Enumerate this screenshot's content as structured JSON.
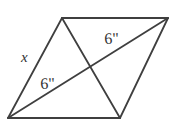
{
  "figure": {
    "type": "geometry-diagram",
    "shape_name": "parallelogram-with-diagonals",
    "background_color": "#ffffff",
    "stroke_color": "#3f3f3f",
    "stroke_width": 1.6,
    "canvas": {
      "width": 173,
      "height": 127
    },
    "vertices": {
      "top_left": {
        "x": 62,
        "y": 18
      },
      "top_right": {
        "x": 168,
        "y": 18
      },
      "bottom_right": {
        "x": 120,
        "y": 118
      },
      "bottom_left": {
        "x": 8,
        "y": 118
      }
    },
    "intersection_point": {
      "x": 88,
      "y": 68
    },
    "sides": [
      {
        "name": "top-side",
        "from": "top_left",
        "to": "top_right"
      },
      {
        "name": "right-side",
        "from": "top_right",
        "to": "bottom_right"
      },
      {
        "name": "bottom-side",
        "from": "bottom_right",
        "to": "bottom_left"
      },
      {
        "name": "left-side",
        "from": "bottom_left",
        "to": "top_left"
      }
    ],
    "diagonals": [
      {
        "name": "diagonal-bottomleft-topright",
        "from": "bottom_left",
        "to": "top_right"
      },
      {
        "name": "diagonal-topleft-bottomright",
        "from": "top_left",
        "to": "bottom_right"
      }
    ],
    "labels": {
      "side_x": "x",
      "diagonal_lower": "6\"",
      "diagonal_upper": "6\""
    }
  }
}
